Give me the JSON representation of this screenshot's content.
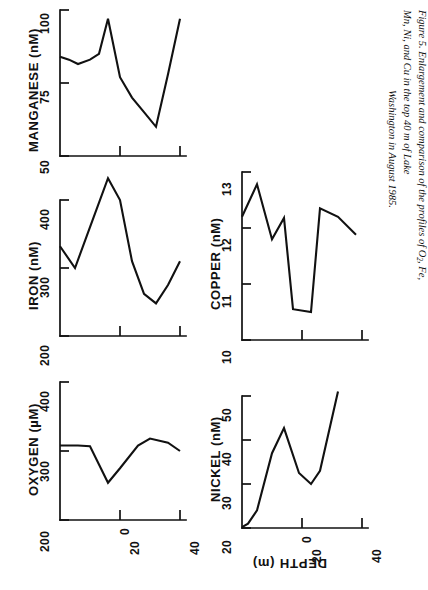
{
  "figure": {
    "caption_line1": "Figure 5.  Enlargement and comparison of the profiles of O",
    "caption_sub": "2",
    "caption_line1b": ", Fe, Mn, Ni, and Cu in the top 40 m of Lake",
    "caption_line2": "Washington in August 1985.",
    "shared_xlabel": "DEPTH (m)",
    "shared_xticks": [
      "0",
      "20",
      "40"
    ],
    "shared_xlim": [
      0,
      42
    ]
  },
  "chart_data": [
    {
      "id": "manganese",
      "type": "line",
      "title": "",
      "ylabel": "MANGANESE  (nM)",
      "xlabel": "DEPTH (m)",
      "yticks": [
        "50",
        "75",
        "100"
      ],
      "ylim": [
        50,
        100
      ],
      "xlim": [
        0,
        42
      ],
      "xticks": [
        0,
        20,
        40
      ],
      "grid": false,
      "legend": "none",
      "x": [
        0,
        3,
        6,
        10,
        13,
        16,
        20,
        24,
        28,
        32,
        36,
        40
      ],
      "values": [
        84,
        83,
        81.5,
        83,
        85,
        97,
        77,
        70,
        65,
        60,
        78,
        97
      ]
    },
    {
      "id": "iron",
      "type": "line",
      "title": "",
      "ylabel": "IRON  (nM)",
      "xlabel": "DEPTH (m)",
      "yticks": [
        "200",
        "300",
        "400"
      ],
      "ylim": [
        200,
        420
      ],
      "xlim": [
        0,
        42
      ],
      "xticks": [
        0,
        20,
        40
      ],
      "grid": false,
      "legend": "none",
      "x": [
        0,
        5,
        10,
        16,
        20,
        24,
        28,
        32,
        36,
        40
      ],
      "values": [
        332,
        300,
        360,
        432,
        400,
        310,
        262,
        248,
        275,
        310
      ]
    },
    {
      "id": "oxygen",
      "type": "line",
      "title": "",
      "ylabel": "OXYGEN  (µM)",
      "xlabel": "DEPTH (m)",
      "yticks": [
        "200",
        "300",
        "400"
      ],
      "ylim": [
        200,
        410
      ],
      "xlim": [
        0,
        42
      ],
      "xticks": [
        0,
        20,
        40
      ],
      "grid": false,
      "legend": "none",
      "x": [
        0,
        6,
        10,
        16,
        20,
        26,
        30,
        36,
        40
      ],
      "values": [
        308,
        308,
        307,
        254,
        275,
        308,
        318,
        312,
        300
      ]
    },
    {
      "id": "copper",
      "type": "line",
      "title": "",
      "ylabel": "COPPER  (nM)",
      "xlabel": "DEPTH (m)",
      "yticks": [
        "10",
        "11",
        "12",
        "13"
      ],
      "ylim": [
        10,
        13
      ],
      "xlim": [
        0,
        42
      ],
      "xticks": [
        0,
        20,
        40
      ],
      "grid": false,
      "legend": "none",
      "x": [
        0,
        5,
        10,
        14,
        17,
        23,
        26,
        32,
        38
      ],
      "values": [
        12.2,
        12.78,
        11.8,
        12.18,
        10.55,
        10.5,
        12.35,
        12.2,
        11.88
      ]
    },
    {
      "id": "nickel",
      "type": "line",
      "title": "",
      "ylabel": "NICKEL  (nM)",
      "xlabel": "DEPTH (m)",
      "yticks": [
        "20",
        "30",
        "40",
        "50"
      ],
      "ylim": [
        20,
        52
      ],
      "xlim": [
        0,
        42
      ],
      "xticks": [
        0,
        20,
        40
      ],
      "grid": false,
      "legend": "none",
      "x": [
        0,
        2,
        5,
        10,
        14,
        19,
        23,
        26,
        32
      ],
      "values": [
        20.2,
        21,
        24,
        37,
        42.7,
        32.5,
        30,
        33,
        51
      ]
    }
  ]
}
